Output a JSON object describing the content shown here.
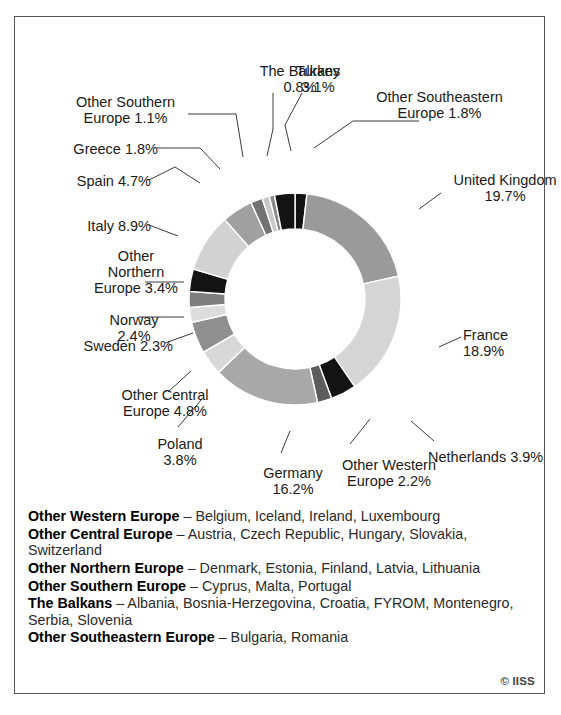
{
  "chart_data": {
    "type": "pie",
    "variant": "donut",
    "title": "",
    "subtitle": "",
    "xlabel": "",
    "ylabel": "",
    "legend_position": "callout-labels",
    "grid": false,
    "units": "percent",
    "categories": [
      "Other Southeastern Europe",
      "United Kingdom",
      "France",
      "Netherlands",
      "Other Western Europe",
      "Germany",
      "Poland",
      "Other Central Europe",
      "Sweden",
      "Norway",
      "Other Northern Europe",
      "Italy",
      "Spain",
      "Greece",
      "Other Southern Europe",
      "The Balkans",
      "Turkey"
    ],
    "values": [
      1.8,
      19.7,
      18.9,
      3.9,
      2.2,
      16.2,
      3.8,
      4.8,
      2.3,
      2.4,
      3.4,
      8.9,
      4.7,
      1.8,
      1.1,
      0.8,
      3.1
    ],
    "slice_colors": [
      "#131313",
      "#9a9a9a",
      "#d5d5d5",
      "#131313",
      "#5c5c5c",
      "#a8a8a8",
      "#d8d8d8",
      "#8f8f8f",
      "#dcdcdc",
      "#7e7e7e",
      "#131313",
      "#d2d2d2",
      "#a0a0a0",
      "#727272",
      "#c8c8c8",
      "#8a8a8a",
      "#131313"
    ],
    "start_angle_deg": 0,
    "outer_radius": 106,
    "inner_radius": 70,
    "center_x": 280,
    "center_y": 282
  },
  "labels": [
    {
      "name": "the-balkans",
      "text": "The Balkans\n0.8%",
      "align": "center",
      "x": 230,
      "y": 46,
      "width": 110
    },
    {
      "name": "turkey",
      "text": "Turkey\n3.1%",
      "align": "center",
      "x": 253,
      "y": 46,
      "width": 100
    },
    {
      "name": "other-southeastern-europe",
      "text": "Other Southeastern\nEurope 1.8%",
      "align": "center",
      "x": 337,
      "y": 72,
      "width": 175
    },
    {
      "name": "united-kingdom",
      "text": "United Kingdom\n19.7%",
      "align": "center",
      "x": 420,
      "y": 155,
      "width": 140
    },
    {
      "name": "france",
      "text": "France\n18.9%",
      "align": "left",
      "x": 448,
      "y": 310,
      "width": 80
    },
    {
      "name": "netherlands",
      "text": "Netherlands 3.9%",
      "align": "left",
      "x": 413,
      "y": 432,
      "width": 140
    },
    {
      "name": "other-western-europe",
      "text": "Other Western\nEurope 2.2%",
      "align": "center",
      "x": 309,
      "y": 440,
      "width": 130
    },
    {
      "name": "germany",
      "text": "Germany\n16.2%",
      "align": "center",
      "x": 228,
      "y": 448,
      "width": 100
    },
    {
      "name": "poland",
      "text": "Poland\n3.8%",
      "align": "center",
      "x": 125,
      "y": 419,
      "width": 80
    },
    {
      "name": "other-central-europe",
      "text": "Other Central\nEurope 4.8%",
      "align": "center",
      "x": 85,
      "y": 370,
      "width": 130
    },
    {
      "name": "sweden",
      "text": "Sweden 2.3%",
      "align": "right",
      "x": 28,
      "y": 321,
      "width": 130
    },
    {
      "name": "norway",
      "text": "Norway\n2.4%",
      "align": "center",
      "x": 74,
      "y": 295,
      "width": 90
    },
    {
      "name": "other-northern-europe",
      "text": "Other\nNorthern\nEurope 3.4%",
      "align": "center",
      "x": 66,
      "y": 231,
      "width": 110
    },
    {
      "name": "italy",
      "text": "Italy 8.9%",
      "align": "right",
      "x": 26,
      "y": 201,
      "width": 110
    },
    {
      "name": "spain",
      "text": "Spain 4.7%",
      "align": "right",
      "x": 26,
      "y": 156,
      "width": 110
    },
    {
      "name": "greece",
      "text": "Greece 1.8%",
      "align": "right",
      "x": 18,
      "y": 124,
      "width": 125
    },
    {
      "name": "other-southern-europe",
      "text": "Other Southern\nEurope 1.1%",
      "align": "center",
      "x": 43,
      "y": 77,
      "width": 135
    }
  ],
  "leader_lines": [
    {
      "name": "leader-the-balkans",
      "points": "258,76 258,112 252,139"
    },
    {
      "name": "leader-turkey",
      "points": "287,76 270,108 276,134"
    },
    {
      "name": "leader-other-southeastern-europe",
      "points": "404,104 338,104 299,131"
    },
    {
      "name": "leader-united-kingdom",
      "points": "426,176 404,192"
    },
    {
      "name": "leader-france",
      "points": "446,320 424,330"
    },
    {
      "name": "leader-netherlands",
      "points": "419,424 396,404"
    },
    {
      "name": "leader-other-western-europe",
      "points": "335,427 355,402"
    },
    {
      "name": "leader-germany",
      "points": "266,436 275,414"
    },
    {
      "name": "leader-poland",
      "points": "163,410 187,382"
    },
    {
      "name": "leader-other-central-europe",
      "points": "153,375 176,354"
    },
    {
      "name": "leader-sweden",
      "points": "150,326 178,316"
    },
    {
      "name": "leader-norway",
      "points": "124,300 169,300"
    },
    {
      "name": "leader-other-northern-europe",
      "points": "130,265 169,265"
    },
    {
      "name": "leader-italy",
      "points": "134,208 163,219"
    },
    {
      "name": "leader-spain",
      "points": "134,163 160,150 185,166"
    },
    {
      "name": "leader-greece",
      "points": "142,131 185,131 205,152"
    },
    {
      "name": "leader-other-southern-europe",
      "points": "173,97 221,97 228,140"
    }
  ],
  "legend": {
    "dash": "–",
    "rows": [
      {
        "term": "Other Western Europe",
        "members": "Belgium, Iceland, Ireland, Luxembourg"
      },
      {
        "term": "Other Central Europe",
        "members": "Austria, Czech Republic, Hungary, Slovakia, Switzerland"
      },
      {
        "term": "Other Northern Europe",
        "members": "Denmark, Estonia, Finland, Latvia, Lithuania"
      },
      {
        "term": "Other Southern Europe",
        "members": "Cyprus, Malta, Portugal"
      },
      {
        "term": "The Balkans",
        "members": "Albania, Bosnia-Herzegovina, Croatia, FYROM, Montenegro, Serbia, Slovenia"
      },
      {
        "term": "Other Southeastern Europe",
        "members": "Bulgaria, Romania"
      }
    ]
  },
  "credit": "© IISS",
  "colors": {
    "frame": "#555555",
    "text": "#1a1a1a",
    "leader": "#3a3a3a",
    "background": "#ffffff"
  }
}
